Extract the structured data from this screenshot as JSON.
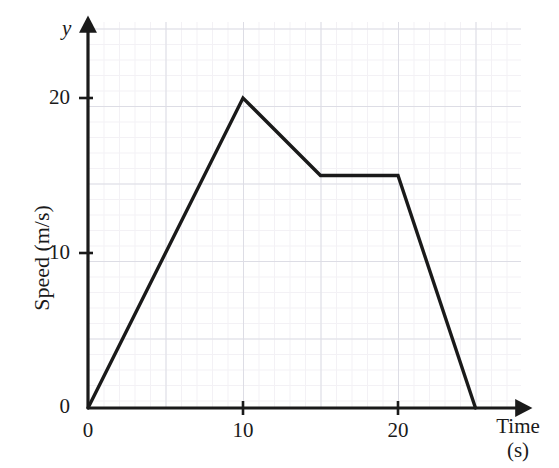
{
  "chart_data": {
    "type": "line",
    "title": "",
    "subtitle": "",
    "xlabel": "Time",
    "xunit": "(s)",
    "ylabel": "Speed (m/s)",
    "y_axis_variable": "y",
    "xlim": [
      0,
      28
    ],
    "ylim": [
      0,
      25
    ],
    "xticks": [
      0,
      10,
      20
    ],
    "xtick_labels": [
      "0",
      "10",
      "20"
    ],
    "yticks": [
      0,
      10,
      20
    ],
    "ytick_labels": [
      "0",
      "10",
      "20"
    ],
    "x_minor_step": 1,
    "y_minor_step": 1,
    "x_major_step": 5,
    "y_major_step": 5,
    "grid": true,
    "grid_style": "graph-paper",
    "legend": false,
    "series": [
      {
        "name": "speed",
        "x": [
          0,
          10,
          15,
          20,
          25
        ],
        "values": [
          0,
          20,
          15,
          15,
          0
        ],
        "color": "#1a1a1a",
        "line_width": 3.4,
        "marker": "none"
      }
    ],
    "annotations": [],
    "origin_label": "0"
  },
  "axes": {
    "y_tick_texts": [
      "20",
      "10",
      "0"
    ],
    "x_tick_texts": [
      "0",
      "10",
      "20"
    ],
    "x_origin_text": "0",
    "y_origin_text": "0",
    "y_title": "Speed (m/s)",
    "y_symbol": "y",
    "x_title": "Time",
    "x_unit": "(s)"
  },
  "colors": {
    "line": "#1a1a1a",
    "axis": "#1a1a1a",
    "grid_minor": "#eceaf0",
    "grid_major": "#c9c9d6",
    "background": "#ffffff",
    "text": "#1a1a1a"
  }
}
